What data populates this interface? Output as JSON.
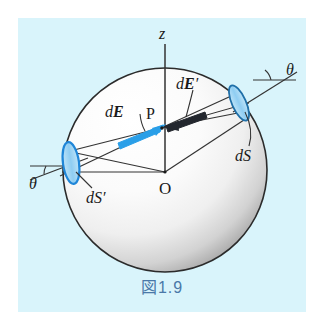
{
  "figure": {
    "caption": "図1.9",
    "caption_color": "#4a78a8",
    "panel_background": "#d9f4fb",
    "page_background": "#ffffff",
    "sphere": {
      "outline_color": "#2b2b2b",
      "fill_light": "#fdfdfd",
      "fill_shadow": "#9a9a9a",
      "center_x": 165,
      "center_y": 170,
      "radius": 102
    },
    "patch_color_fill": "#a8d8f5",
    "patch_color_stroke": "#1f86d8",
    "line_color": "#333333"
  },
  "labels": {
    "axis_z": "z",
    "origin": "O",
    "point_p": "P",
    "field_dE": {
      "d": "d",
      "E": "E",
      "prime": ""
    },
    "field_dE_prime": {
      "d": "d",
      "E": "E",
      "prime": "′"
    },
    "area_dS": {
      "d": "d",
      "S": "S",
      "prime": ""
    },
    "area_dS_prime": {
      "d": "d",
      "S": "S",
      "prime": "′"
    },
    "angle_theta_right": "θ",
    "angle_theta_left": "θ"
  }
}
